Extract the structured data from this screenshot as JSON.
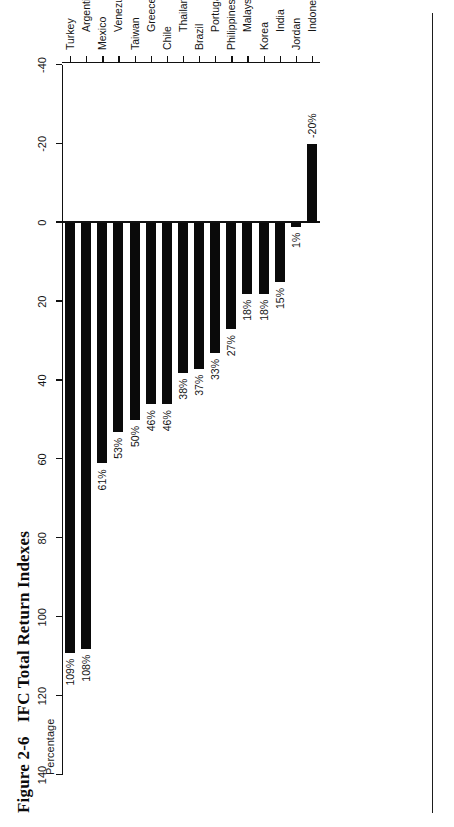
{
  "figure": {
    "number": "Figure 2-6",
    "title": "IFC Total Return Indexes",
    "axis_title": "Percentage"
  },
  "chart_data": {
    "type": "bar",
    "orientation": "vertical",
    "title": "IFC Total Return Indexes",
    "xlabel": "",
    "ylabel": "Percentage",
    "ylim": [
      -40,
      140
    ],
    "yticks": [
      140,
      120,
      100,
      80,
      60,
      40,
      20,
      0,
      -20,
      -40
    ],
    "ytick_labels": [
      "140",
      "120",
      "100",
      "80",
      "60",
      "40",
      "20",
      "0",
      "-20",
      "-40"
    ],
    "grid": false,
    "legend": false,
    "categories": [
      "Turkey",
      "Argentina",
      "Mexico",
      "Venezuela",
      "Taiwan",
      "Greece",
      "Chile",
      "Thailand",
      "Brazil",
      "Portugal",
      "Philippines",
      "Malaysia",
      "Korea",
      "India",
      "Jordan",
      "Indonesia"
    ],
    "values": [
      109,
      108,
      61,
      53,
      50,
      46,
      46,
      38,
      37,
      33,
      27,
      18,
      18,
      15,
      1,
      -20
    ],
    "data_labels": [
      "109%",
      "108%",
      "61%",
      "53%",
      "50%",
      "46%",
      "46%",
      "38%",
      "37%",
      "33%",
      "27%",
      "18%",
      "18%",
      "15%",
      "1%",
      "-20%"
    ],
    "bar_color": "#0a0a0a"
  },
  "colors": {
    "bar": "#0a0a0a",
    "axis": "#111111",
    "text": "#151515",
    "background": "#ffffff"
  }
}
